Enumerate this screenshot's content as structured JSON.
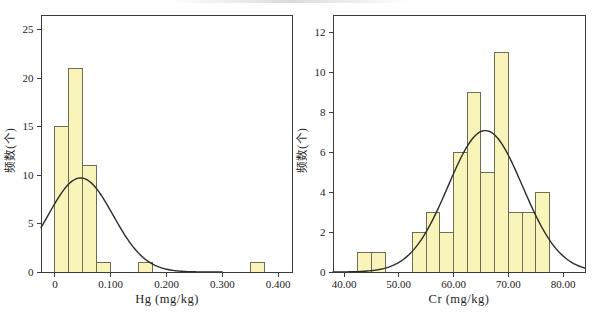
{
  "figure": {
    "background": "#ffffff",
    "description_labels": {
      "hg_xlabel": "Hg (mg/kg)",
      "hg_ylabel": "频数(个)",
      "cr_xlabel": "Cr (mg/kg)",
      "cr_ylabel": "频数(个)"
    }
  },
  "chart_data": [
    {
      "type": "bar",
      "subtype": "histogram-with-normal-curve",
      "name": "Hg-frequency-histogram",
      "title": "",
      "xlabel": "Hg (mg/kg)",
      "ylabel": "频数(个)",
      "xlim": [
        -0.025,
        0.425
      ],
      "ylim": [
        0,
        26.5
      ],
      "grid": false,
      "legend": "none",
      "x_ticks": [
        {
          "value": 0.0,
          "label": "0"
        },
        {
          "value": 0.1,
          "label": "0.100"
        },
        {
          "value": 0.2,
          "label": "0.200"
        },
        {
          "value": 0.3,
          "label": "0.300"
        },
        {
          "value": 0.4,
          "label": "0.400"
        }
      ],
      "y_ticks": [
        {
          "value": 0,
          "label": "0"
        },
        {
          "value": 5,
          "label": "5"
        },
        {
          "value": 10,
          "label": "10"
        },
        {
          "value": 15,
          "label": "15"
        },
        {
          "value": 20,
          "label": "20"
        },
        {
          "value": 25,
          "label": "25"
        }
      ],
      "bin_width": 0.025,
      "bars": [
        {
          "bin_start": 0.0,
          "count": 15
        },
        {
          "bin_start": 0.025,
          "count": 21
        },
        {
          "bin_start": 0.05,
          "count": 11
        },
        {
          "bin_start": 0.075,
          "count": 1
        },
        {
          "bin_start": 0.15,
          "count": 1
        },
        {
          "bin_start": 0.35,
          "count": 1
        }
      ],
      "normal_curve": {
        "mean": 0.046,
        "sd": 0.058,
        "peak_height": 9.7,
        "draw_from": -0.025,
        "draw_to": 0.3
      },
      "colors": {
        "bar_fill": "#f8f4ba",
        "bar_stroke": "#6f6b55",
        "curve": "#2b2b2b",
        "axis": "#3b3b3b",
        "tick_text": "#222222"
      }
    },
    {
      "type": "bar",
      "subtype": "histogram-with-normal-curve",
      "name": "Cr-frequency-histogram",
      "title": "",
      "xlabel": "Cr (mg/kg)",
      "ylabel": "频数(个)",
      "xlim": [
        38,
        84
      ],
      "ylim": [
        0,
        12.9
      ],
      "grid": false,
      "legend": "none",
      "x_ticks": [
        {
          "value": 40,
          "label": "40.00"
        },
        {
          "value": 50,
          "label": "50.00"
        },
        {
          "value": 60,
          "label": "60.00"
        },
        {
          "value": 70,
          "label": "70.00"
        },
        {
          "value": 80,
          "label": "80.00"
        }
      ],
      "y_ticks": [
        {
          "value": 0,
          "label": "0"
        },
        {
          "value": 2,
          "label": "2"
        },
        {
          "value": 4,
          "label": "4"
        },
        {
          "value": 6,
          "label": "6"
        },
        {
          "value": 8,
          "label": "8"
        },
        {
          "value": 10,
          "label": "10"
        },
        {
          "value": 12,
          "label": "12"
        }
      ],
      "bin_width": 2.5,
      "bars": [
        {
          "bin_start": 42.5,
          "count": 1
        },
        {
          "bin_start": 45.0,
          "count": 1
        },
        {
          "bin_start": 52.5,
          "count": 2
        },
        {
          "bin_start": 55.0,
          "count": 3
        },
        {
          "bin_start": 57.5,
          "count": 2
        },
        {
          "bin_start": 60.0,
          "count": 6
        },
        {
          "bin_start": 62.5,
          "count": 9
        },
        {
          "bin_start": 65.0,
          "count": 5
        },
        {
          "bin_start": 67.5,
          "count": 11
        },
        {
          "bin_start": 70.0,
          "count": 3
        },
        {
          "bin_start": 72.5,
          "count": 3
        },
        {
          "bin_start": 75.0,
          "count": 4
        }
      ],
      "normal_curve": {
        "mean": 65.8,
        "sd": 6.8,
        "peak_height": 7.1,
        "draw_from": 38,
        "draw_to": 84
      },
      "colors": {
        "bar_fill": "#f8f4ba",
        "bar_stroke": "#6f6b55",
        "curve": "#2b2b2b",
        "axis": "#3b3b3b",
        "tick_text": "#222222"
      }
    }
  ]
}
